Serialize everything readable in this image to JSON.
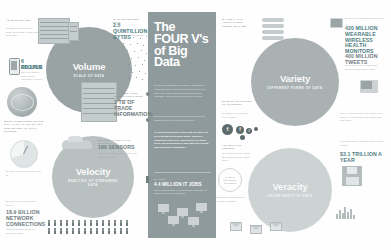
{
  "poster": {
    "title": "The FOUR V's of Big Data",
    "background_color": "#fefefe",
    "accent_teal": "#4e7d84",
    "center_panel_color": "#8e9a9b"
  },
  "center": {
    "title": "The FOUR V's of Big Data",
    "paragraphs": [
      "We are witnessing an explosion of data that is being generated and collected every single day, from every digital process and social media exchange, from sensors and mobile devices.",
      "Big data is arriving from multiple sources at an alarming velocity, volume and variety.",
      "To extract meaningful value from big data, you need optimal processing power, analytics capabilities and skills. Businesses are using these four dimensions to turn data into insight and competitive advantage."
    ],
    "stat": {
      "eyebrow": "By 2015",
      "number": "4.4 MILLION IT JOBS",
      "note": "will be created globally to support big data, generating 1.9 million IT jobs in the United States."
    }
  },
  "vs": [
    {
      "id": "volume",
      "name": "Volume",
      "subtitle": "SCALE OF DATA",
      "color": "#9aa3a4"
    },
    {
      "id": "velocity",
      "name": "Velocity",
      "subtitle": "ANALYSIS OF STREAMING DATA",
      "color": "#b9c0c0"
    },
    {
      "id": "variety",
      "name": "Variety",
      "subtitle": "DIFFERENT FORMS OF DATA",
      "color": "#a9b1b2"
    },
    {
      "id": "veracity",
      "name": "Veracity",
      "subtitle": "UNCERTAINTY OF DATA",
      "color": "#cdd3d3"
    }
  ],
  "stats": {
    "top_left": {
      "eyebrow": "40 ZETTABYTES",
      "number": "40 ZETTABYTES",
      "body": "of data will be created by 2020, an increase of 300 times from 2005."
    },
    "phone": {
      "number": "6 BILLION",
      "label": "PEOPLE",
      "body": "have cell phones today. World population: 7 billion."
    },
    "globe_caption": "MOST COMPANIES IN THE U.S. HAVE AT LEAST 100 TERABYTES OF DATA STORED",
    "network": {
      "eyebrow": "By 2016 it is projected there will be",
      "number": "18.9 BILLION NETWORK CONNECTIONS",
      "body": "almost 2.5 connections per person on earth."
    },
    "nyse": {
      "eyebrow": "The New York Stock Exchange captures",
      "number": "1 TB OF TRADE INFORMATION",
      "body": "during each trading session."
    },
    "modern_cars": {
      "eyebrow": "Modern cars have close to",
      "number": "100 SENSORS",
      "body": "that monitor items such as fuel level and tire pressure."
    },
    "scan_rate": {
      "eyebrow": "It is estimated that",
      "number": "2.5 QUINTILLION BYTES",
      "body": "of data are created each day."
    },
    "social": {
      "eyebrow": "30 BILLION PIECES OF CONTENT",
      "body": "are shared on Facebook every month."
    },
    "video": {
      "eyebrow": "400 MILLION TWEETS",
      "body": "are sent per day by about 200 million monthly active users."
    },
    "healthcare": {
      "eyebrow": "By 2014, it's anticipated there will be",
      "number": "420 MILLION WEARABLE WIRELESS HEALTH MONITORS",
      "body": ""
    },
    "poor_quality": {
      "eyebrow": "Poor data quality costs the US economy around",
      "number": "$3.1 TRILLION A YEAR"
    },
    "uncertainty": {
      "number": "1 IN 3",
      "label": "BUSINESS LEADERS",
      "body": "don't trust the information they use to make decisions."
    },
    "trust_note": "27% of respondents in one survey were unsure of how much of their data was inaccurate."
  }
}
